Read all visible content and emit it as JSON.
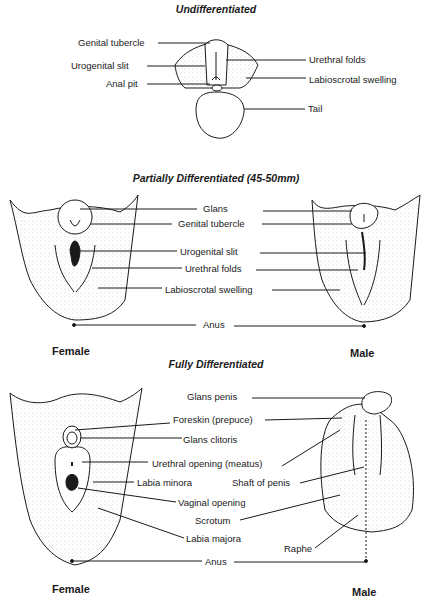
{
  "figure": {
    "stages": [
      {
        "title": "Undifferentiated",
        "labels_left": [
          "Genital tubercle",
          "Urogenital slit",
          "Anal pit"
        ],
        "labels_right": [
          "Urethral folds",
          "Labioscrotal swelling",
          "Tail"
        ]
      },
      {
        "title": "Partially Differentiated (45-50mm)",
        "labels_center": [
          "Glans",
          "Genital tubercle",
          "Urogenital slit",
          "Urethral folds",
          "Labioscrotal swelling",
          "Anus"
        ],
        "left_caption": "Female",
        "right_caption": "Male"
      },
      {
        "title": "Fully Differentiated",
        "labels_center": [
          "Glans penis",
          "Foreskin (prepuce)",
          "Glans clitoris",
          "Urethral opening (meatus)",
          "Labia minora",
          "Shaft of penis",
          "Vaginal opening",
          "Scrotum",
          "Labia majora",
          "Raphe",
          "Anus"
        ],
        "left_caption": "Female",
        "right_caption": "Male"
      }
    ],
    "colors": {
      "ink": "#1a1a1a",
      "stipple": "#9a9a9a",
      "background": "#ffffff"
    }
  }
}
